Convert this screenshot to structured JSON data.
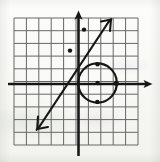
{
  "document": {
    "kind": "scanned-math-graph",
    "title": "Coordinate plane graph with line and circle",
    "background_color": "#fbfbf9",
    "ink_color": "#1a1a1a",
    "grid_color": "#5a5a5a"
  },
  "canvas": {
    "width": 160,
    "height": 162
  },
  "grid": {
    "label": "square grid",
    "left": 14,
    "top": 18,
    "right": 138,
    "bottom": 145,
    "cell_size": 12.4,
    "columns": 10,
    "rows": 10,
    "visible": true
  },
  "axes": {
    "x_axis": {
      "label": "x-axis",
      "y": 84,
      "x_start": 8,
      "x_end": 152,
      "arrow_right": true,
      "arrow_left": false
    },
    "y_axis": {
      "label": "y-axis",
      "x": 78.5,
      "y_start": 12,
      "y_end": 156,
      "arrow_up": true,
      "arrow_down": false
    },
    "origin": {
      "x": 78.5,
      "y": 84
    }
  },
  "chart_data": {
    "type": "scatter",
    "title": "",
    "xlabel": "x",
    "ylabel": "y",
    "grid": true,
    "legend": null,
    "unit_pixels": 12.4,
    "origin_px": [
      78.5,
      84
    ],
    "xlim": [
      -5.2,
      4.8
    ],
    "ylim": [
      -4.9,
      5.3
    ],
    "series": [
      {
        "name": "line",
        "type": "line",
        "slope": 1.5,
        "intercept": -0.7,
        "endpoints_px": [
          [
            38,
            128
          ],
          [
            110,
            20
          ]
        ],
        "arrow_start": true,
        "arrow_end": true,
        "marked_points_px": [
          [
            70,
            50.5
          ],
          [
            84,
            29.5
          ]
        ]
      },
      {
        "name": "circle",
        "type": "circle",
        "center_px": [
          97.5,
          83
        ],
        "radius_px": 19,
        "center_units": [
          1.53,
          0.08
        ],
        "radius_units": 1.53,
        "marked_points_px": [
          [
            97.5,
            83
          ],
          [
            97.5,
            64
          ],
          [
            97.5,
            102
          ],
          [
            116.5,
            83
          ]
        ]
      }
    ]
  },
  "annotations": {
    "point_marker_radius": 2.2,
    "line_width_axis": 2.6,
    "line_width_grid": 1.0,
    "line_width_curve": 2.2
  }
}
